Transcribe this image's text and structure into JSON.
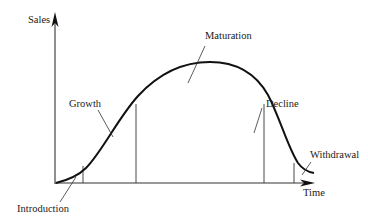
{
  "diagram": {
    "axes": {
      "y_label": "Sales",
      "x_label": "Time"
    },
    "stages": [
      {
        "id": "introduction",
        "label": "Introduction"
      },
      {
        "id": "growth",
        "label": "Growth"
      },
      {
        "id": "maturation",
        "label": "Maturation"
      },
      {
        "id": "decline",
        "label": "Decline"
      },
      {
        "id": "withdrawal",
        "label": "Withdrawal"
      }
    ],
    "colors": {
      "line": "#1a1a1a",
      "background": "#ffffff"
    }
  }
}
